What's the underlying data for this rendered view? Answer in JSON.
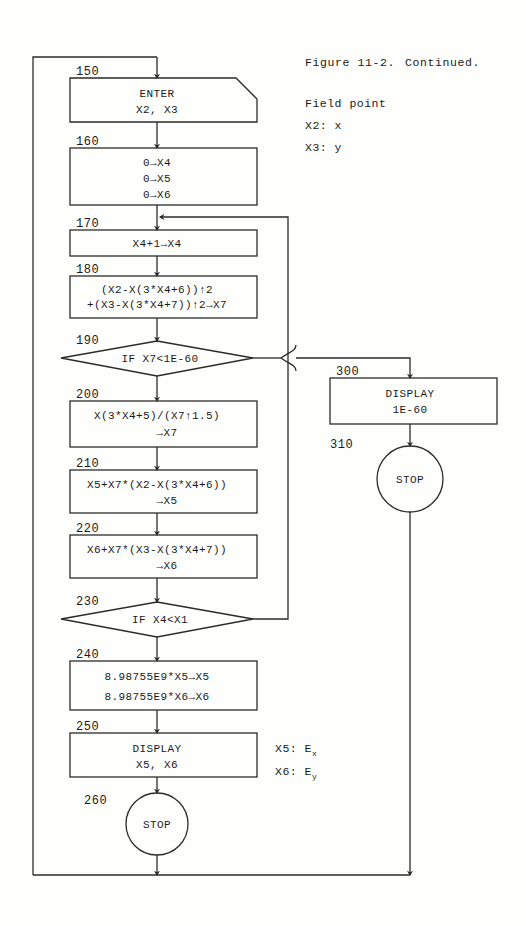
{
  "caption": {
    "figure": "Figure 11-2.",
    "continued": "Continued."
  },
  "legend": {
    "heading": "Field point",
    "items": [
      "X2: x",
      "X3: y"
    ]
  },
  "output_annotations": [
    {
      "var": "X5: E",
      "sub": "x"
    },
    {
      "var": "X6: E",
      "sub": "y"
    }
  ],
  "flowchart": {
    "type": "program-flowchart",
    "nodes": [
      {
        "id": "n150",
        "step": "150",
        "shape": "input",
        "lines": [
          "ENTER",
          "X2, X3"
        ]
      },
      {
        "id": "n160",
        "step": "160",
        "shape": "process",
        "lines": [
          "0→X4",
          "0→X5",
          "0→X6"
        ]
      },
      {
        "id": "n170",
        "step": "170",
        "shape": "process",
        "lines": [
          "X4+1→X4"
        ]
      },
      {
        "id": "n180",
        "step": "180",
        "shape": "process",
        "lines": [
          "(X2-X(3*X4+6))↑2",
          "+(X3-X(3*X4+7))↑2→X7"
        ]
      },
      {
        "id": "n190",
        "step": "190",
        "shape": "decision",
        "lines": [
          "IF X7<1E-60"
        ]
      },
      {
        "id": "n200",
        "step": "200",
        "shape": "process",
        "lines": [
          "X(3*X4+5)/(X7↑1.5)",
          "→X7"
        ]
      },
      {
        "id": "n210",
        "step": "210",
        "shape": "process",
        "lines": [
          "X5+X7*(X2-X(3*X4+6))",
          "→X5"
        ]
      },
      {
        "id": "n220",
        "step": "220",
        "shape": "process",
        "lines": [
          "X6+X7*(X3-X(3*X4+7))",
          "→X6"
        ]
      },
      {
        "id": "n230",
        "step": "230",
        "shape": "decision",
        "lines": [
          "IF X4<X1"
        ]
      },
      {
        "id": "n240",
        "step": "240",
        "shape": "process",
        "lines": [
          "8.98755E9*X5→X5",
          "8.98755E9*X6→X6"
        ]
      },
      {
        "id": "n250",
        "step": "250",
        "shape": "process",
        "lines": [
          "DISPLAY",
          "X5, X6"
        ]
      },
      {
        "id": "n260",
        "step": "260",
        "shape": "terminal",
        "lines": [
          "STOP"
        ]
      },
      {
        "id": "n300",
        "step": "300",
        "shape": "process",
        "lines": [
          "DISPLAY",
          "1E-60"
        ]
      },
      {
        "id": "n310",
        "step": "310",
        "shape": "terminal",
        "lines": [
          "STOP"
        ]
      }
    ]
  },
  "colors": {
    "ink": "#2b2b2b",
    "paper": "#fefefd"
  }
}
